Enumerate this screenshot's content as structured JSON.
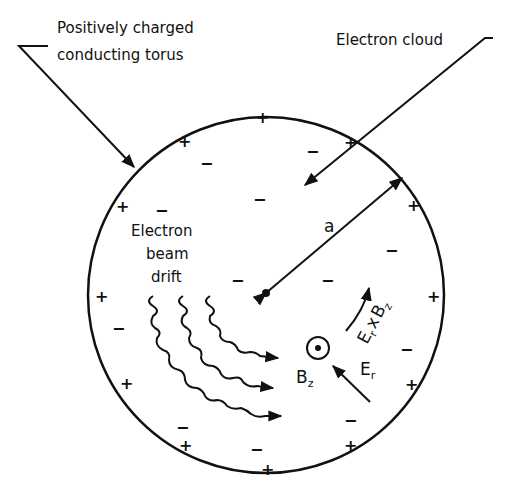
{
  "labels": {
    "torus_line1": "Positively charged",
    "torus_line2": "conducting torus",
    "cloud": "Electron cloud",
    "beam_line1": "Electron",
    "beam_line2": "beam",
    "beam_line3": "drift",
    "radius": "a",
    "bfield": "B",
    "bfield_sub": "z",
    "efield": "E",
    "efield_sub": "r",
    "cross_E": "E",
    "cross_E_sub": "r",
    "cross_x": "x",
    "cross_B": "B",
    "cross_B_sub": "z"
  },
  "symbols": {
    "plus": "+",
    "minus": "−"
  },
  "colors": {
    "ink": "#111111",
    "background": "#ffffff"
  }
}
